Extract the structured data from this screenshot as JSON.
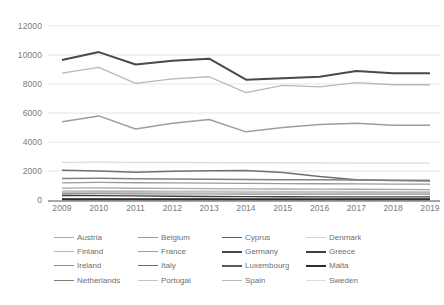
{
  "chart_data": {
    "type": "line",
    "title": "",
    "xlabel": "",
    "ylabel": "",
    "categories": [
      2009,
      2010,
      2011,
      2012,
      2013,
      2014,
      2015,
      2016,
      2017,
      2018,
      2019
    ],
    "x_tick_labels": [
      "2009",
      "2010",
      "2011",
      "2012",
      "2013",
      "2014",
      "2015",
      "2016",
      "2017",
      "2018",
      "2019"
    ],
    "y_tick_labels": [
      "12000",
      "10000",
      "8000",
      "6000",
      "4000",
      "2000",
      "0"
    ],
    "y_ticks": [
      12000,
      10000,
      8000,
      6000,
      4000,
      2000,
      0
    ],
    "ylim": [
      0,
      12000
    ],
    "grid": true,
    "legend_position": "bottom",
    "series": [
      {
        "name": "Austria",
        "color": "#a8a8a8",
        "width": 1.3,
        "values": [
          820,
          830,
          810,
          800,
          790,
          770,
          760,
          750,
          740,
          730,
          720
        ]
      },
      {
        "name": "Belgium",
        "color": "#9a9a9a",
        "width": 1.3,
        "values": [
          1180,
          1210,
          1190,
          1180,
          1160,
          1140,
          1130,
          1120,
          1110,
          1100,
          1090
        ]
      },
      {
        "name": "Cyprus",
        "color": "#5f5f5f",
        "width": 1.3,
        "values": [
          95,
          100,
          95,
          90,
          85,
          80,
          80,
          80,
          85,
          85,
          85
        ]
      },
      {
        "name": "Denmark",
        "color": "#d2d2d2",
        "width": 1.3,
        "values": [
          640,
          650,
          640,
          630,
          620,
          610,
          600,
          600,
          595,
          590,
          585
        ]
      },
      {
        "name": "Finland",
        "color": "#b5b5b5",
        "width": 1.3,
        "values": [
          560,
          580,
          570,
          565,
          560,
          550,
          545,
          540,
          535,
          530,
          525
        ]
      },
      {
        "name": "France",
        "color": "#9e9e9e",
        "width": 1.5,
        "values": [
          5400,
          5800,
          4900,
          5300,
          5550,
          4700,
          5000,
          5200,
          5300,
          5150,
          5150
        ]
      },
      {
        "name": "Germany",
        "color": "#4a4a4a",
        "width": 2.0,
        "values": [
          9650,
          10200,
          9350,
          9600,
          9750,
          8300,
          8400,
          8500,
          8900,
          8750,
          8750
        ]
      },
      {
        "name": "Greece",
        "color": "#3d3d3d",
        "width": 1.3,
        "values": [
          310,
          300,
          280,
          260,
          240,
          230,
          225,
          220,
          220,
          215,
          215
        ]
      },
      {
        "name": "Ireland",
        "color": "#8c8c8c",
        "width": 1.3,
        "values": [
          430,
          440,
          430,
          425,
          420,
          415,
          415,
          410,
          410,
          405,
          405
        ]
      },
      {
        "name": "Italy",
        "color": "#707070",
        "width": 1.5,
        "values": [
          2050,
          2000,
          1920,
          1980,
          2010,
          2030,
          1900,
          1620,
          1400,
          1340,
          1310
        ]
      },
      {
        "name": "Luxembourg",
        "color": "#5a5a5a",
        "width": 1.3,
        "values": [
          70,
          72,
          70,
          68,
          66,
          64,
          63,
          62,
          62,
          61,
          61
        ]
      },
      {
        "name": "Malta",
        "color": "#2e2e2e",
        "width": 1.5,
        "values": [
          40,
          42,
          40,
          39,
          38,
          37,
          36,
          36,
          35,
          35,
          35
        ]
      },
      {
        "name": "Netherlands",
        "color": "#818181",
        "width": 1.5,
        "values": [
          1480,
          1500,
          1470,
          1450,
          1430,
          1410,
          1400,
          1390,
          1380,
          1370,
          1360
        ]
      },
      {
        "name": "Portugal",
        "color": "#c0c0c0",
        "width": 1.3,
        "values": [
          520,
          515,
          500,
          490,
          480,
          470,
          465,
          460,
          455,
          450,
          448
        ]
      },
      {
        "name": "Spain",
        "color": "#b8b8b8",
        "width": 1.3,
        "values": [
          8750,
          9150,
          8050,
          8350,
          8500,
          7400,
          7900,
          7800,
          8100,
          7950,
          7950
        ]
      },
      {
        "name": "Sweden",
        "color": "#dadada",
        "width": 1.3,
        "values": [
          2600,
          2610,
          2600,
          2590,
          2580,
          2570,
          2565,
          2560,
          2550,
          2545,
          2540
        ]
      }
    ]
  },
  "legend": {
    "rows": [
      [
        {
          "label": "Austria",
          "color": "#a8a8a8",
          "width": 1.6
        },
        {
          "label": "Belgium",
          "color": "#9a9a9a",
          "width": 1.6
        },
        {
          "label": "Cyprus",
          "color": "#5f5f5f",
          "width": 1.6
        },
        {
          "label": "Denmark",
          "color": "#d2d2d2",
          "width": 1.6
        }
      ],
      [
        {
          "label": "Finland",
          "color": "#b5b5b5",
          "width": 1.6
        },
        {
          "label": "France",
          "color": "#9e9e9e",
          "width": 1.6
        },
        {
          "label": "Germany",
          "color": "#4a4a4a",
          "width": 2.4
        },
        {
          "label": "Greece",
          "color": "#3d3d3d",
          "width": 2.4
        }
      ],
      [
        {
          "label": "Ireland",
          "color": "#8c8c8c",
          "width": 1.9
        },
        {
          "label": "Italy",
          "color": "#707070",
          "width": 1.9
        },
        {
          "label": "Luxembourg",
          "color": "#5a5a5a",
          "width": 2.2
        },
        {
          "label": "Malta",
          "color": "#2e2e2e",
          "width": 2.4
        }
      ],
      [
        {
          "label": "Netherlands",
          "color": "#818181",
          "width": 1.9
        },
        {
          "label": "Portugal",
          "color": "#c0c0c0",
          "width": 1.6
        },
        {
          "label": "Spain",
          "color": "#b8b8b8",
          "width": 1.6
        },
        {
          "label": "Sweden",
          "color": "#dadada",
          "width": 1.6
        }
      ]
    ]
  }
}
